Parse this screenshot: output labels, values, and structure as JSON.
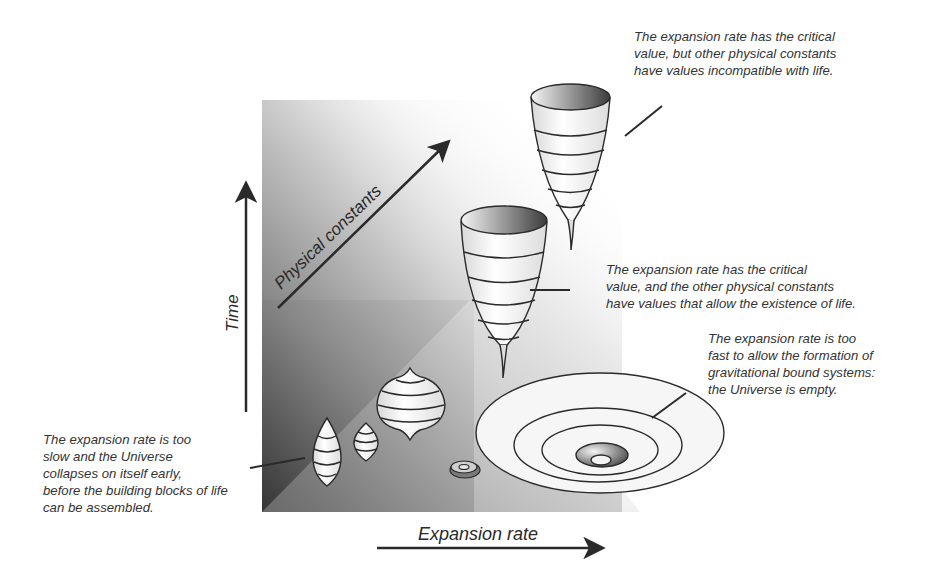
{
  "axes": {
    "x_label": "Expansion rate",
    "y_label": "Time",
    "diagonal_label": "Physical constants"
  },
  "captions": {
    "top_right": "The expansion rate has the critical\nvalue, but other physical constants\nhave values incompatible with life.",
    "middle_right": "The expansion rate has the critical\nvalue, and the other physical constants\nhave values that allow the existence of life.",
    "lower_right": "The expansion rate is too\nfast to allow the formation of\ngravitational bound systems:\nthe Universe is empty.",
    "bottom_left": "The expansion rate is too\nslow and the Universe\ncollapses on itself early,\nbefore the building blocks of life\ncan be assembled."
  },
  "shapes": [
    {
      "id": "cone-critical-incompatible",
      "kind": "goblet-cone"
    },
    {
      "id": "cone-critical-life",
      "kind": "goblet-cone"
    },
    {
      "id": "disk-too-fast",
      "kind": "concentric-disk"
    },
    {
      "id": "small-disk",
      "kind": "small-disk"
    },
    {
      "id": "spindle-large",
      "kind": "spindle"
    },
    {
      "id": "spindle-small",
      "kind": "spindle"
    },
    {
      "id": "onion-bulb",
      "kind": "bulb"
    }
  ],
  "colors": {
    "background": "#ffffff",
    "panel_dark": "#3a3a3a",
    "panel_light": "#f4f4f4",
    "line": "#2a2a2a",
    "shape_fill": "#f2f2f2"
  }
}
